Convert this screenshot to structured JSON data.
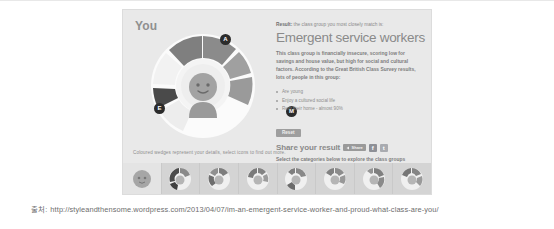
{
  "slide": {
    "source_label": "출처:",
    "source_url": "http://styleandthensome.wordpress.com/2013/04/07/im-an-emergent-service-worker-and-proud-what-class-are-you/"
  },
  "widget": {
    "you_label": "You",
    "wheel_caption": "Coloured wedges represent your details, select icons to find out more.",
    "markers": [
      {
        "name": "marker-top",
        "letter": "A"
      },
      {
        "name": "marker-left",
        "letter": "E"
      },
      {
        "name": "marker-right",
        "letter": "M"
      }
    ],
    "result": {
      "kicker_bold": "Result:",
      "kicker_rest": " the class group you most closely match is:",
      "title": "Emergent service workers",
      "body": "This class group is financially insecure, scoring low for savings and house value, but high for social and cultural factors. According to the Great British Class Survey results, lots of people in this group:",
      "bullets": [
        "Are young",
        "Enjoy a cultured social life",
        "Rent their home - almost 90%"
      ],
      "reset_label": "Reset",
      "share_title": "Share your result",
      "share_button_label": "Share",
      "facebook_label": "f",
      "twitter_label": "t",
      "select_line": "Select the categories below to explore the class groups"
    },
    "thumbnails": [
      {
        "name": "thumb-you",
        "selected": true
      },
      {
        "name": "thumb-class-2",
        "selected": false
      },
      {
        "name": "thumb-class-3",
        "selected": false
      },
      {
        "name": "thumb-class-4",
        "selected": false
      },
      {
        "name": "thumb-class-5",
        "selected": false
      },
      {
        "name": "thumb-class-6",
        "selected": false
      },
      {
        "name": "thumb-class-7",
        "selected": false
      },
      {
        "name": "thumb-class-8",
        "selected": false
      }
    ],
    "colors": {
      "panel_bg": "#e9e9e9",
      "wedge_dark": "#8b8b8b",
      "wedge_mid": "#9d9d9d",
      "wedge_light": "#b4b4b4",
      "wedge_darkest": "#4a4a4a",
      "avatar": "#9a9a9a",
      "strip_bg": "#d4d4d4",
      "accent_text": "#8a8a8a"
    }
  }
}
